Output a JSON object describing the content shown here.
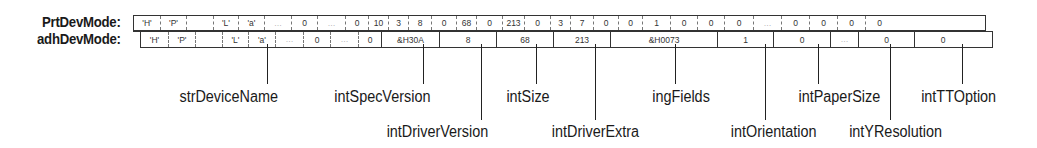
{
  "rows": {
    "prt": {
      "label": "PrtDevMode:",
      "cells": [
        {
          "v": "'H'",
          "w": 26
        },
        {
          "v": "'P'",
          "w": 26
        },
        {
          "v": "",
          "w": 27
        },
        {
          "v": "'L'",
          "w": 25
        },
        {
          "v": "'a'",
          "w": 26
        },
        {
          "v": "...",
          "w": 27
        },
        {
          "v": "0",
          "w": 26
        },
        {
          "v": "...",
          "w": 28
        },
        {
          "v": "0",
          "w": 23
        },
        {
          "v": "10",
          "w": 20
        },
        {
          "v": "3",
          "w": 20
        },
        {
          "v": "8",
          "w": 23
        },
        {
          "v": "0",
          "w": 25
        },
        {
          "v": "68",
          "w": 20
        },
        {
          "v": "0",
          "w": 26
        },
        {
          "v": "213",
          "w": 22
        },
        {
          "v": "0",
          "w": 26
        },
        {
          "v": "3",
          "w": 20
        },
        {
          "v": "7",
          "w": 23
        },
        {
          "v": "0",
          "w": 25
        },
        {
          "v": "0",
          "w": 24
        },
        {
          "v": "1",
          "w": 28
        },
        {
          "v": "0",
          "w": 27
        },
        {
          "v": "0",
          "w": 27
        },
        {
          "v": "0",
          "w": 29
        },
        {
          "v": "...",
          "w": 28
        },
        {
          "v": "0",
          "w": 28
        },
        {
          "v": "0",
          "w": 28
        },
        {
          "v": "0",
          "w": 28
        },
        {
          "v": "0",
          "w": 28
        }
      ]
    },
    "adh": {
      "label": "adhDevMode:",
      "cells": [
        {
          "v": "'H'",
          "w": 27,
          "b": "first"
        },
        {
          "v": "'P'",
          "w": 27,
          "b": "dash"
        },
        {
          "v": "",
          "w": 27,
          "b": "dash"
        },
        {
          "v": "'L'",
          "w": 26,
          "b": "dash"
        },
        {
          "v": "'a'",
          "w": 27,
          "b": "dash"
        },
        {
          "v": "...",
          "w": 28,
          "b": "dash"
        },
        {
          "v": "0",
          "w": 27,
          "b": "dash"
        },
        {
          "v": "...",
          "w": 28,
          "b": "dash"
        },
        {
          "v": "0",
          "w": 23,
          "b": "dash"
        },
        {
          "v": "&H30A",
          "w": 58,
          "b": "solid"
        },
        {
          "v": "8",
          "w": 57,
          "b": "solid"
        },
        {
          "v": "68",
          "w": 57,
          "b": "solid"
        },
        {
          "v": "213",
          "w": 57,
          "b": "solid"
        },
        {
          "v": "&H0073",
          "w": 107,
          "b": "solid"
        },
        {
          "v": "1",
          "w": 56,
          "b": "solid"
        },
        {
          "v": "0",
          "w": 57,
          "b": "solid"
        },
        {
          "v": "...",
          "w": 28,
          "b": "solid"
        },
        {
          "v": "0",
          "w": 56,
          "b": "solid"
        },
        {
          "v": "0",
          "w": 57,
          "b": "solid"
        }
      ]
    }
  },
  "fields": [
    {
      "name": "strDeviceName",
      "x": 267,
      "tier": "upper"
    },
    {
      "name": "intSpecVersion",
      "x": 423,
      "tier": "upper"
    },
    {
      "name": "intDriverVersion",
      "x": 481,
      "tier": "lower"
    },
    {
      "name": "intSize",
      "x": 536,
      "tier": "upper"
    },
    {
      "name": "intDriverExtra",
      "x": 595,
      "tier": "lower"
    },
    {
      "name": "ingFields",
      "x": 675,
      "tier": "upper"
    },
    {
      "name": "intOrientation",
      "x": 765,
      "tier": "lower"
    },
    {
      "name": "intPaperSize",
      "x": 818,
      "tier": "upper"
    },
    {
      "name": "intYResolution",
      "x": 890,
      "tier": "lower"
    },
    {
      "name": "intTTOption",
      "x": 962,
      "tier": "upper"
    }
  ],
  "colors": {
    "line": "#222222",
    "text": "#1a1a1a",
    "background": "#ffffff"
  }
}
